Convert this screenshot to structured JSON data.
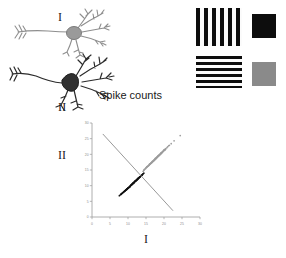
{
  "neurons": [
    {
      "id": "neuron-one",
      "label": "I",
      "color": "#8e8e8e",
      "soma_fill": "#9a9a9a"
    },
    {
      "id": "neuron-two",
      "label": "II",
      "color": "#2b2b2b",
      "soma_fill": "#303030"
    }
  ],
  "stimuli": [
    {
      "name": "vertical-grating",
      "orientation": "vertical",
      "bar_count": 6,
      "swatch_color": "#0d0d0d",
      "bar_color": "#0d0d0d"
    },
    {
      "name": "horizontal-grating",
      "orientation": "horizontal",
      "bar_count": 6,
      "swatch_color": "#8a8a8a",
      "bar_color": "#0d0d0d"
    }
  ],
  "chart_data": {
    "type": "scatter",
    "title": "Spike counts",
    "xlabel": "I",
    "ylabel": "II",
    "xlim": [
      0,
      30
    ],
    "ylim": [
      0,
      30
    ],
    "xticks": [
      0,
      5,
      10,
      15,
      20,
      25,
      30
    ],
    "yticks": [
      0,
      5,
      10,
      15,
      20,
      25,
      30
    ],
    "grid": false,
    "legend": "none",
    "series": [
      {
        "name": "black-stimulus-cluster",
        "color": "#111111",
        "marker": "dot",
        "n": 180,
        "center": [
          12.0,
          11.5
        ],
        "x": [
          8.2,
          9.1,
          10.4,
          11.2,
          12.6,
          13.1,
          9.8,
          10.9,
          11.7,
          12.2,
          13.8,
          8.9,
          10.1,
          11.4,
          12.9,
          14.2,
          9.4,
          10.6,
          11.9,
          13.3,
          8.6,
          9.9,
          11.1,
          12.4,
          13.6,
          10.2,
          11.6,
          12.8,
          9.2,
          10.8,
          12.1,
          13.4,
          8.4,
          9.7,
          11.3,
          12.6,
          14.0,
          10.5,
          11.8,
          13.0,
          9.0,
          10.3,
          11.5,
          12.7,
          13.9,
          8.8,
          10.0,
          11.2,
          12.3,
          13.5,
          9.6,
          10.7,
          12.0,
          13.2,
          8.1,
          9.3,
          10.9,
          12.5,
          13.7,
          11.0,
          7.9,
          8.7,
          9.5,
          10.6,
          11.7,
          12.9,
          14.1,
          9.1,
          10.4,
          11.6,
          12.8,
          13.3,
          8.3,
          9.8,
          11.1,
          12.2,
          13.0,
          10.2,
          11.4,
          12.6,
          7.6,
          8.5,
          9.9,
          11.3,
          12.7,
          13.8,
          10.8,
          12.1,
          9.4,
          10.0,
          11.8,
          13.1,
          8.0,
          9.6,
          10.5,
          11.9,
          12.4,
          13.6,
          14.4,
          10.1
        ],
        "y": [
          7.4,
          8.3,
          9.6,
          10.6,
          12.0,
          12.6,
          9.0,
          10.2,
          11.0,
          11.6,
          13.3,
          8.1,
          9.3,
          10.8,
          12.4,
          13.8,
          8.6,
          9.9,
          11.3,
          12.8,
          7.8,
          9.1,
          10.4,
          11.8,
          13.1,
          9.4,
          10.9,
          12.3,
          8.4,
          10.1,
          11.5,
          12.9,
          7.6,
          8.9,
          10.6,
          12.0,
          13.5,
          9.7,
          11.2,
          12.5,
          8.2,
          9.5,
          10.7,
          12.1,
          13.4,
          8.0,
          9.2,
          10.5,
          11.7,
          13.0,
          8.8,
          10.0,
          11.4,
          12.7,
          7.3,
          8.5,
          10.2,
          11.9,
          13.2,
          10.3,
          7.1,
          7.9,
          8.7,
          9.8,
          11.1,
          12.4,
          13.7,
          8.3,
          9.6,
          10.9,
          12.2,
          12.8,
          7.5,
          9.0,
          10.4,
          11.6,
          12.5,
          9.4,
          10.8,
          12.1,
          6.8,
          7.7,
          9.1,
          10.7,
          12.2,
          13.3,
          10.1,
          11.6,
          8.6,
          9.2,
          11.3,
          12.6,
          7.2,
          8.8,
          9.7,
          11.4,
          11.8,
          13.1,
          14.0,
          9.3
        ]
      },
      {
        "name": "gray-stimulus-cluster",
        "color": "#9c9c9c",
        "marker": "dot",
        "n": 180,
        "center": [
          17.5,
          18.5
        ],
        "x": [
          14.6,
          15.4,
          16.2,
          17.0,
          17.8,
          18.6,
          15.0,
          15.9,
          16.7,
          17.5,
          18.3,
          19.1,
          14.8,
          15.6,
          16.4,
          17.2,
          18.0,
          18.8,
          19.6,
          15.2,
          16.0,
          16.8,
          17.6,
          18.4,
          19.2,
          20.0,
          14.4,
          15.8,
          16.6,
          17.4,
          18.2,
          19.0,
          19.8,
          15.5,
          16.3,
          17.1,
          17.9,
          18.7,
          19.5,
          20.3,
          14.9,
          16.1,
          16.9,
          17.7,
          18.5,
          19.3,
          20.1,
          15.3,
          16.5,
          17.3,
          18.1,
          18.9,
          19.7,
          20.5,
          14.2,
          15.1,
          16.7,
          17.5,
          18.3,
          19.1,
          19.9,
          21.0,
          15.7,
          16.4,
          17.2,
          18.0,
          18.8,
          19.6,
          20.4,
          21.3,
          14.5,
          15.3,
          16.1,
          17.0,
          17.8,
          18.6,
          19.4,
          20.2,
          21.5,
          16.2,
          17.1,
          17.9,
          18.7,
          19.5,
          20.3,
          22.0,
          15.9,
          16.8,
          17.6,
          18.4,
          19.2,
          20.0,
          20.8,
          22.8,
          16.6,
          17.4,
          18.2,
          19.0,
          19.8,
          24.5
        ],
        "y": [
          15.2,
          16.1,
          17.0,
          17.9,
          18.8,
          19.7,
          15.7,
          16.6,
          17.5,
          18.4,
          19.3,
          20.2,
          15.4,
          16.3,
          17.2,
          18.1,
          19.0,
          19.9,
          20.8,
          16.0,
          16.9,
          17.8,
          18.7,
          19.6,
          20.5,
          21.4,
          14.9,
          16.5,
          17.4,
          18.3,
          19.2,
          20.1,
          21.0,
          16.2,
          17.1,
          18.0,
          18.9,
          19.8,
          20.7,
          21.6,
          15.5,
          16.8,
          17.7,
          18.6,
          19.5,
          20.4,
          21.3,
          16.1,
          17.3,
          18.2,
          19.1,
          20.0,
          20.9,
          21.8,
          14.6,
          15.8,
          17.6,
          18.5,
          19.4,
          20.3,
          21.2,
          22.4,
          16.4,
          17.2,
          18.1,
          19.0,
          19.9,
          20.8,
          21.7,
          22.7,
          15.1,
          16.0,
          16.9,
          17.8,
          18.7,
          19.6,
          20.5,
          21.4,
          22.9,
          17.0,
          17.9,
          18.8,
          19.7,
          20.6,
          21.5,
          23.4,
          16.7,
          17.6,
          18.5,
          19.4,
          20.3,
          21.2,
          22.1,
          24.3,
          17.4,
          18.3,
          19.2,
          20.1,
          21.0,
          26.0
        ]
      }
    ],
    "decision_boundary": {
      "name": "decision-boundary-line",
      "color": "#8d8d8d",
      "from": [
        3.0,
        26.5
      ],
      "to": [
        22.5,
        2.0
      ]
    }
  }
}
